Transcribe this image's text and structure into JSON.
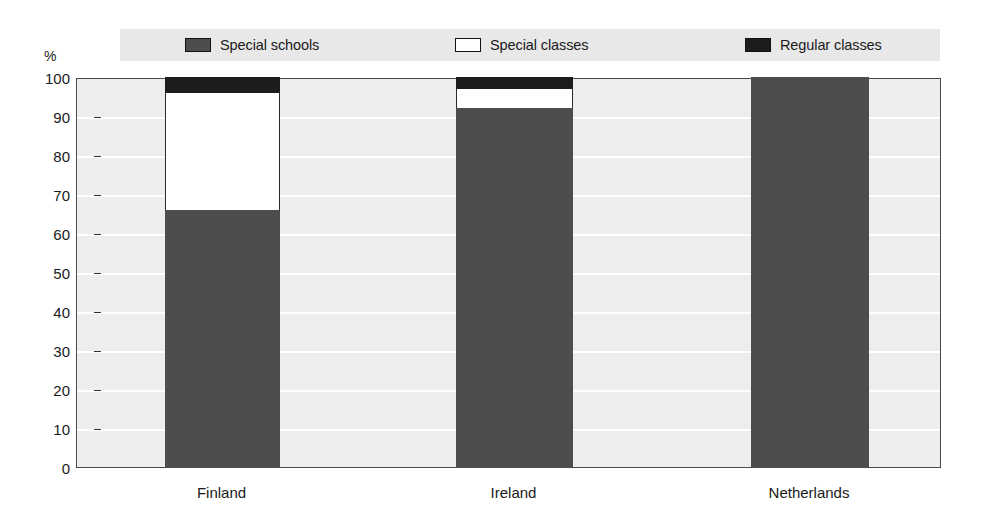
{
  "axis": {
    "unit_label": "%",
    "y_ticks": [
      0,
      10,
      20,
      30,
      40,
      50,
      60,
      70,
      80,
      90,
      100
    ]
  },
  "legend": {
    "items": [
      {
        "label": "Special schools",
        "swatch": "legend-swatch-special-schools",
        "color": "#4d4d4d"
      },
      {
        "label": "Special classes",
        "swatch": "legend-swatch-special-classes",
        "color": "#ffffff"
      },
      {
        "label": "Regular classes",
        "swatch": "legend-swatch-regular-classes",
        "color": "#1c1c1c"
      }
    ]
  },
  "categories": [
    "Finland",
    "Ireland",
    "Netherlands"
  ],
  "colors": {
    "special_schools": "#4d4d4d",
    "special_classes": "#ffffff",
    "regular_classes": "#1c1c1c",
    "plot_background": "#ededed",
    "gridline": "#ffffff",
    "legend_background": "#e8e8e8",
    "frame": "#4a4a4a"
  },
  "chart_data": {
    "type": "bar",
    "title": "",
    "subtitle": "",
    "xlabel": "",
    "ylabel": "%",
    "ylim": [
      0,
      100
    ],
    "ytick_step": 10,
    "grid": true,
    "stacked": true,
    "stack_total": 100,
    "legend_position": "top",
    "categories": [
      "Finland",
      "Ireland",
      "Netherlands"
    ],
    "series": [
      {
        "name": "Special schools",
        "values": [
          66,
          92,
          100
        ]
      },
      {
        "name": "Special classes",
        "values": [
          30,
          5,
          0
        ]
      },
      {
        "name": "Regular classes",
        "values": [
          4,
          3,
          0
        ]
      }
    ],
    "annotations": []
  }
}
